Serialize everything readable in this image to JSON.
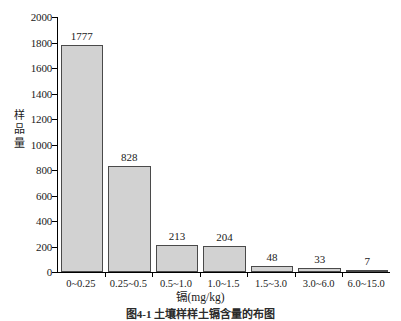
{
  "chart_data": {
    "type": "bar",
    "title": "",
    "categories": [
      "0~0.25",
      "0.25~0.5",
      "0.5~1.0",
      "1.0~1.5",
      "1.5~3.0",
      "3.0~6.0",
      "6.0~15.0"
    ],
    "values": [
      1777,
      828,
      213,
      204,
      48,
      33,
      7
    ],
    "value_labels": [
      "1777",
      "828",
      "213",
      "204",
      "48",
      "33",
      "7"
    ],
    "xlabel": "镉(mg/kg)",
    "ylabel": "样品量",
    "ylabel_chars": [
      "样",
      "品",
      "量"
    ],
    "ylim": [
      0,
      2000
    ],
    "ytick_labels": [
      "2000",
      "1800",
      "1600",
      "1400",
      "1200",
      "1000",
      "800",
      "600",
      "400",
      "200",
      "0"
    ],
    "ytick_values": [
      2000,
      1800,
      1600,
      1400,
      1200,
      1000,
      800,
      600,
      400,
      200,
      0
    ],
    "grid": false,
    "legend": false,
    "bar_fill_color": "#d2d2d2",
    "bar_border_color": "#4a4a4a",
    "axis_color": "#000000",
    "background_color": "#ffffff"
  },
  "caption": "图4-1 土壤样样土镉含量的布图"
}
